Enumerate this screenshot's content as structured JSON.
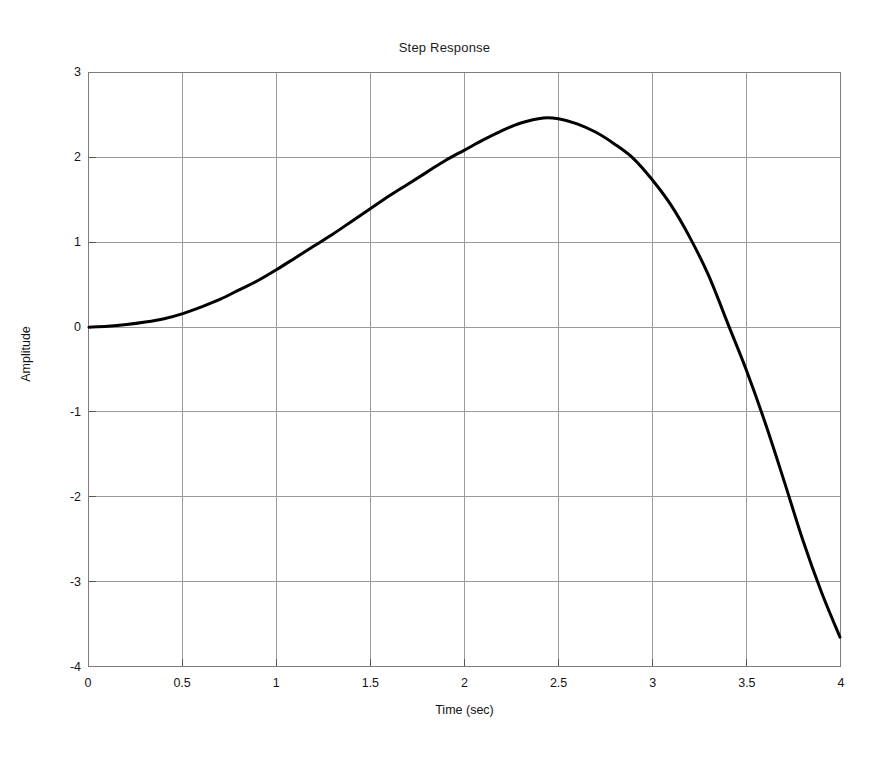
{
  "figure": {
    "background_color": "#ffffff",
    "axes_color": "#7d7d7d",
    "grid_color": "#9a9a9a",
    "curve_color": "#000000"
  },
  "chart_data": {
    "type": "line",
    "title": "Step Response",
    "xlabel": "Time (sec)",
    "ylabel": "Amplitude",
    "xlim": [
      0,
      4
    ],
    "ylim": [
      -4,
      3
    ],
    "grid": true,
    "legend": null,
    "xticks": [
      "0",
      "0.5",
      "1",
      "1.5",
      "2",
      "2.5",
      "3",
      "3.5",
      "4"
    ],
    "xtick_values": [
      0,
      0.5,
      1,
      1.5,
      2,
      2.5,
      3,
      3.5,
      4
    ],
    "yticks": [
      "3",
      "2",
      "1",
      "0",
      "-1",
      "-2",
      "-3",
      "-4"
    ],
    "ytick_values": [
      3,
      2,
      1,
      0,
      -1,
      -2,
      -3,
      -4
    ],
    "series": [
      {
        "name": "step response",
        "x": [
          0.0,
          0.1,
          0.2,
          0.3,
          0.4,
          0.5,
          0.6,
          0.7,
          0.8,
          0.9,
          1.0,
          1.1,
          1.2,
          1.3,
          1.4,
          1.5,
          1.6,
          1.7,
          1.8,
          1.9,
          2.0,
          2.1,
          2.2,
          2.3,
          2.42,
          2.5,
          2.6,
          2.7,
          2.8,
          2.9,
          3.0,
          3.1,
          3.2,
          3.3,
          3.41,
          3.5,
          3.6,
          3.7,
          3.8,
          3.9,
          4.0
        ],
        "y": [
          0.0,
          0.01,
          0.03,
          0.06,
          0.1,
          0.16,
          0.24,
          0.33,
          0.44,
          0.55,
          0.68,
          0.82,
          0.96,
          1.1,
          1.25,
          1.4,
          1.55,
          1.69,
          1.83,
          1.97,
          2.09,
          2.21,
          2.32,
          2.41,
          2.47,
          2.46,
          2.4,
          2.3,
          2.16,
          1.99,
          1.74,
          1.44,
          1.06,
          0.61,
          0.0,
          -0.5,
          -1.12,
          -1.8,
          -2.5,
          -3.12,
          -3.66
        ]
      }
    ],
    "annotations": {
      "peak_amplitude": 2.47,
      "peak_time": 2.42,
      "zero_crossing_time": 3.41,
      "final_value": -3.66
    }
  }
}
